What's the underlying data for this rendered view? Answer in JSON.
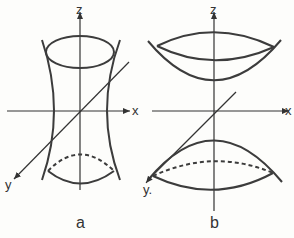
{
  "figure": {
    "panels": [
      {
        "id": "a",
        "caption": "a",
        "surface": "hyperboloid of one sheet",
        "axes": {
          "z": "z",
          "x": "x",
          "y": "y"
        }
      },
      {
        "id": "b",
        "caption": "b",
        "surface": "hyperboloid of two sheets",
        "axes": {
          "z": "z",
          "x": "x",
          "y": "y."
        }
      }
    ],
    "colors": {
      "line": "#3c3c3c",
      "background": "#fdfdfb"
    }
  }
}
